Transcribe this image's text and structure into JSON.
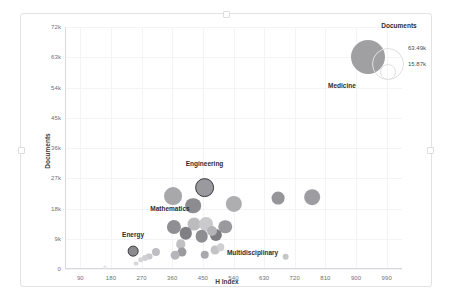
{
  "chart_data": {
    "type": "scatter",
    "title": "",
    "xlabel": "H Index",
    "ylabel": "Documents",
    "xlim": [
      45,
      1035
    ],
    "ylim": [
      0,
      72000
    ],
    "grid": true,
    "xticks": [
      "90",
      "180",
      "270",
      "360",
      "450",
      "540",
      "630",
      "720",
      "810",
      "900",
      "990"
    ],
    "xtick_values": [
      90,
      180,
      270,
      360,
      450,
      540,
      630,
      720,
      810,
      900,
      990
    ],
    "yticks": [
      "0",
      "9k",
      "18k",
      "27k",
      "36k",
      "45k",
      "54k",
      "63k",
      "72k"
    ],
    "ytick_values": [
      0,
      9000,
      18000,
      27000,
      36000,
      45000,
      54000,
      63000,
      72000
    ],
    "size_field": "Documents",
    "legend": {
      "position": "top-right",
      "title": "Documents",
      "entries": [
        {
          "label": "63.49k",
          "value": 63490
        },
        {
          "label": "15.87k",
          "value": 15870
        }
      ]
    },
    "points": [
      {
        "label": "Medicine",
        "x": 935,
        "y": 63000,
        "size": 63490,
        "shade": "#a0a0a3",
        "labeled": true,
        "selected": false,
        "label_dx": -26,
        "label_dy": 17
      },
      {
        "label": "Engineering",
        "x": 455,
        "y": 24200,
        "size": 21500,
        "shade": "#9a9a9e",
        "labeled": true,
        "selected": true,
        "label_dx": 0,
        "label_dy": -15
      },
      {
        "label": "Mathematics",
        "x": 365,
        "y": 12500,
        "size": 11000,
        "shade": "#8e8e93",
        "labeled": true,
        "selected": false,
        "label_dx": -4,
        "label_dy": -12
      },
      {
        "label": "Energy",
        "x": 245,
        "y": 5300,
        "size": 6300,
        "shade": "#8a8a8f",
        "labeled": true,
        "selected": true,
        "label_dx": 0,
        "label_dy": -12
      },
      {
        "label": "Multidisciplinary",
        "x": 693,
        "y": 3700,
        "size": 2500,
        "shade": "#c6c6c9",
        "labeled": true,
        "selected": false,
        "label_dx": -33,
        "label_dy": -1
      },
      {
        "label": "",
        "x": 363,
        "y": 21600,
        "size": 17500,
        "shade": "#a8a8ab",
        "labeled": false,
        "selected": false,
        "label_dx": 0,
        "label_dy": 0
      },
      {
        "label": "",
        "x": 422,
        "y": 18800,
        "size": 13500,
        "shade": "#8b8b90",
        "labeled": false,
        "selected": false,
        "label_dx": 0,
        "label_dy": 0
      },
      {
        "label": "",
        "x": 541,
        "y": 19300,
        "size": 14500,
        "shade": "#aeaeb1",
        "labeled": false,
        "selected": false,
        "label_dx": 0,
        "label_dy": 0
      },
      {
        "label": "",
        "x": 771,
        "y": 21400,
        "size": 13500,
        "shade": "#9d9da1",
        "labeled": false,
        "selected": false,
        "label_dx": 0,
        "label_dy": 0
      },
      {
        "label": "",
        "x": 672,
        "y": 21000,
        "size": 9000,
        "shade": "#96969a",
        "labeled": false,
        "selected": false,
        "label_dx": 0,
        "label_dy": 0
      },
      {
        "label": "",
        "x": 424,
        "y": 13300,
        "size": 9000,
        "shade": "#bcbcbf",
        "labeled": false,
        "selected": false,
        "label_dx": 0,
        "label_dy": 0
      },
      {
        "label": "",
        "x": 459,
        "y": 13400,
        "size": 10500,
        "shade": "#cacacd",
        "labeled": false,
        "selected": false,
        "label_dx": 0,
        "label_dy": 0
      },
      {
        "label": "",
        "x": 516,
        "y": 12600,
        "size": 10000,
        "shade": "#9a9a9e",
        "labeled": false,
        "selected": false,
        "label_dx": 0,
        "label_dy": 0
      },
      {
        "label": "",
        "x": 399,
        "y": 10600,
        "size": 8500,
        "shade": "#7f7f84",
        "labeled": false,
        "selected": false,
        "label_dx": 0,
        "label_dy": 0
      },
      {
        "label": "",
        "x": 447,
        "y": 9700,
        "size": 8800,
        "shade": "#8d8d92",
        "labeled": false,
        "selected": false,
        "label_dx": 0,
        "label_dy": 0
      },
      {
        "label": "",
        "x": 489,
        "y": 10200,
        "size": 8200,
        "shade": "#7c7c81",
        "labeled": false,
        "selected": false,
        "label_dx": 0,
        "label_dy": 0
      },
      {
        "label": "",
        "x": 477,
        "y": 11200,
        "size": 5500,
        "shade": "#b4b4b8",
        "labeled": false,
        "selected": false,
        "label_dx": 0,
        "label_dy": 0
      },
      {
        "label": "",
        "x": 385,
        "y": 7300,
        "size": 5000,
        "shade": "#c0c0c3",
        "labeled": false,
        "selected": false,
        "label_dx": 0,
        "label_dy": 0
      },
      {
        "label": "",
        "x": 389,
        "y": 5200,
        "size": 4500,
        "shade": "#9b9b9f",
        "labeled": false,
        "selected": false,
        "label_dx": 0,
        "label_dy": 0
      },
      {
        "label": "",
        "x": 368,
        "y": 4100,
        "size": 4200,
        "shade": "#b6b6ba",
        "labeled": false,
        "selected": false,
        "label_dx": 0,
        "label_dy": 0
      },
      {
        "label": "",
        "x": 455,
        "y": 4300,
        "size": 4000,
        "shade": "#a9a9ad",
        "labeled": false,
        "selected": false,
        "label_dx": 0,
        "label_dy": 0
      },
      {
        "label": "",
        "x": 487,
        "y": 5700,
        "size": 4300,
        "shade": "#c3c3c6",
        "labeled": false,
        "selected": false,
        "label_dx": 0,
        "label_dy": 0
      },
      {
        "label": "",
        "x": 502,
        "y": 6500,
        "size": 3200,
        "shade": "#cfcfd2",
        "labeled": false,
        "selected": false,
        "label_dx": 0,
        "label_dy": 0
      },
      {
        "label": "",
        "x": 312,
        "y": 5100,
        "size": 3600,
        "shade": "#bfbfc3",
        "labeled": false,
        "selected": false,
        "label_dx": 0,
        "label_dy": 0
      },
      {
        "label": "",
        "x": 292,
        "y": 3700,
        "size": 2600,
        "shade": "#cacacd",
        "labeled": false,
        "selected": false,
        "label_dx": 0,
        "label_dy": 0
      },
      {
        "label": "",
        "x": 281,
        "y": 3400,
        "size": 2000,
        "shade": "#d0d0d3",
        "labeled": false,
        "selected": false,
        "label_dx": 0,
        "label_dy": 0
      },
      {
        "label": "",
        "x": 268,
        "y": 2700,
        "size": 1700,
        "shade": "#d4d4d7",
        "labeled": false,
        "selected": false,
        "label_dx": 0,
        "label_dy": 0
      },
      {
        "label": "",
        "x": 255,
        "y": 1600,
        "size": 1300,
        "shade": "#d8d8db",
        "labeled": false,
        "selected": false,
        "label_dx": 0,
        "label_dy": 0
      },
      {
        "label": "",
        "x": 162,
        "y": 500,
        "size": 600,
        "shade": "#e7e7e9",
        "labeled": false,
        "selected": false,
        "label_dx": 0,
        "label_dy": 0
      }
    ]
  }
}
